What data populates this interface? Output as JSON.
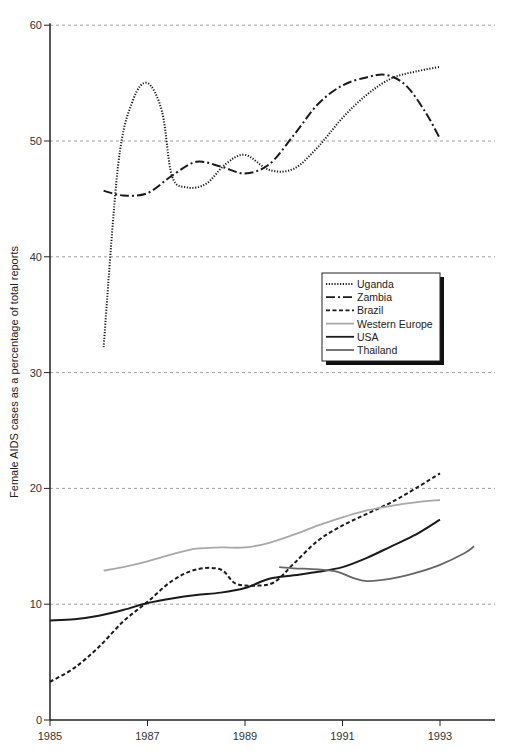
{
  "chart_data": {
    "type": "line",
    "title": "",
    "xlabel": "",
    "ylabel": "Female AIDS cases as a percentage of total reports",
    "xlim": [
      1985,
      1994.2
    ],
    "ylim": [
      0,
      60
    ],
    "x_ticks": [
      "1985",
      "1987",
      "1989",
      "1991",
      "1993"
    ],
    "y_ticks": [
      "0",
      "10",
      "20",
      "30",
      "40",
      "50",
      "60"
    ],
    "grid": "horizontal dashed",
    "legend_position": "right-center",
    "series": [
      {
        "name": "Uganda",
        "style": "dotted",
        "color": "#1a1a1a",
        "x": [
          1986.1,
          1986.4,
          1986.7,
          1987.0,
          1987.3,
          1987.5,
          1987.8,
          1988.2,
          1988.6,
          1989.0,
          1989.5,
          1990.0,
          1990.5,
          1991.0,
          1991.5,
          1992.0,
          1992.5,
          1993.0
        ],
        "y": [
          32.2,
          48.0,
          53.5,
          55.0,
          52.5,
          47.0,
          46.0,
          46.3,
          48.0,
          48.8,
          47.5,
          47.6,
          49.5,
          52.0,
          54.0,
          55.4,
          56.0,
          56.4
        ]
      },
      {
        "name": "Zambia",
        "style": "dash-dot",
        "color": "#1a1a1a",
        "x": [
          1986.1,
          1986.5,
          1987.0,
          1987.5,
          1988.0,
          1988.5,
          1989.0,
          1989.5,
          1990.0,
          1990.5,
          1991.0,
          1991.5,
          1991.9,
          1992.3,
          1992.7,
          1993.0
        ],
        "y": [
          45.7,
          45.3,
          45.5,
          47.0,
          48.2,
          47.8,
          47.2,
          48.0,
          50.5,
          53.2,
          54.8,
          55.5,
          55.7,
          54.8,
          52.5,
          50.2
        ]
      },
      {
        "name": "Brazil",
        "style": "dashed",
        "color": "#1a1a1a",
        "x": [
          1985.0,
          1985.5,
          1986.0,
          1986.5,
          1987.0,
          1987.5,
          1988.0,
          1988.5,
          1988.8,
          1989.2,
          1989.6,
          1990.0,
          1990.5,
          1991.0,
          1991.5,
          1992.0,
          1992.5,
          1993.0
        ],
        "y": [
          3.3,
          4.5,
          6.3,
          8.5,
          10.2,
          12.0,
          13.0,
          13.0,
          11.8,
          11.6,
          11.9,
          13.5,
          15.5,
          16.8,
          17.8,
          18.8,
          20.0,
          21.3
        ]
      },
      {
        "name": "Western Europe",
        "style": "solid",
        "color": "#a8a8a8",
        "x": [
          1986.1,
          1986.5,
          1987.0,
          1987.5,
          1988.0,
          1988.5,
          1989.0,
          1989.5,
          1990.0,
          1990.5,
          1991.0,
          1991.5,
          1992.0,
          1992.5,
          1993.0
        ],
        "y": [
          12.9,
          13.2,
          13.7,
          14.3,
          14.8,
          14.9,
          14.9,
          15.3,
          16.0,
          16.8,
          17.5,
          18.1,
          18.5,
          18.8,
          19.0
        ]
      },
      {
        "name": "USA",
        "style": "solid",
        "color": "#1a1a1a",
        "x": [
          1985.0,
          1985.5,
          1986.0,
          1986.5,
          1987.0,
          1987.5,
          1988.0,
          1988.5,
          1989.0,
          1989.5,
          1990.0,
          1990.5,
          1991.0,
          1991.5,
          1992.0,
          1992.5,
          1993.0
        ],
        "y": [
          8.6,
          8.7,
          9.0,
          9.5,
          10.1,
          10.5,
          10.8,
          11.0,
          11.4,
          12.2,
          12.5,
          12.8,
          13.2,
          14.0,
          15.0,
          16.0,
          17.3
        ]
      },
      {
        "name": "Thailand",
        "style": "solid",
        "color": "#666666",
        "x": [
          1989.7,
          1990.0,
          1990.5,
          1990.9,
          1991.2,
          1991.5,
          1992.0,
          1992.5,
          1993.0,
          1993.5,
          1993.7
        ],
        "y": [
          13.2,
          13.1,
          13.0,
          12.8,
          12.3,
          12.0,
          12.2,
          12.7,
          13.4,
          14.4,
          15.0
        ]
      }
    ]
  }
}
